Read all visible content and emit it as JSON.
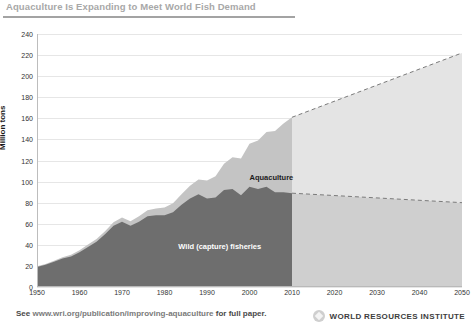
{
  "header": {
    "title": "Aquaculture Is Expanding to Meet World Fish Demand"
  },
  "footer": {
    "prefix": "See",
    "url": "www.wri.org/publication/improving-aquaculture",
    "suffix": "for full paper.",
    "org_name": "WORLD RESOURCES INSTITUTE",
    "logo_icon": "wri-diamond-icon"
  },
  "colors": {
    "wild_historical": "#6e6e6e",
    "aquaculture_historical": "#c4c4c4",
    "wild_projection": "#cfcfcf",
    "aquaculture_projection": "#e4e4e4",
    "gridline": "#e6e6e6",
    "title": "#a8a8a8",
    "dashed_line": "#7a7a7a"
  },
  "chart_data": {
    "type": "area",
    "stacked": true,
    "title": "Aquaculture Is Expanding to Meet World Fish Demand",
    "xlabel": "",
    "ylabel": "Million tons",
    "xlim": [
      1950,
      2050
    ],
    "ylim": [
      0,
      240
    ],
    "ytick_step": 20,
    "grid": true,
    "legend_position": "inline-labels",
    "projection_start": 2010,
    "yticks": [
      0,
      20,
      40,
      60,
      80,
      100,
      120,
      140,
      160,
      180,
      200,
      220,
      240
    ],
    "xticks": [
      1950,
      1960,
      1970,
      1980,
      1990,
      2000,
      2010,
      2020,
      2030,
      2040,
      2050
    ],
    "annotations": [
      {
        "text": "Aquaculture",
        "x": 2000,
        "y": 103
      },
      {
        "text": "Wild (capture) fisheries",
        "x": 1993,
        "y": 38
      }
    ],
    "series": [
      {
        "name": "Wild (capture) fisheries",
        "x": [
          1950,
          1952,
          1954,
          1956,
          1958,
          1960,
          1962,
          1964,
          1966,
          1968,
          1970,
          1972,
          1974,
          1976,
          1978,
          1980,
          1982,
          1984,
          1986,
          1988,
          1990,
          1992,
          1994,
          1996,
          1998,
          2000,
          2002,
          2004,
          2006,
          2008,
          2010
        ],
        "values": [
          19,
          21,
          24,
          27,
          29,
          33,
          38,
          43,
          50,
          58,
          62,
          58,
          62,
          67,
          68,
          68,
          71,
          78,
          84,
          88,
          84,
          85,
          92,
          93,
          87,
          95,
          93,
          95,
          90,
          90,
          89
        ]
      },
      {
        "name": "Aquaculture",
        "x": [
          1950,
          1952,
          1954,
          1956,
          1958,
          1960,
          1962,
          1964,
          1966,
          1968,
          1970,
          1972,
          1974,
          1976,
          1978,
          1980,
          1982,
          1984,
          1986,
          1988,
          1990,
          1992,
          1994,
          1996,
          1998,
          2000,
          2002,
          2004,
          2006,
          2008,
          2010
        ],
        "values": [
          0.6,
          0.8,
          1,
          1.2,
          1.5,
          1.8,
          2.2,
          2.6,
          3,
          3.4,
          3.9,
          4.4,
          5,
          5.7,
          6.5,
          7.3,
          8.4,
          10,
          12,
          14,
          17,
          20,
          25,
          30,
          35,
          41,
          46,
          52,
          58,
          65,
          72
        ]
      }
    ],
    "projection": {
      "x": [
        2010,
        2050
      ],
      "wild_values": [
        89,
        80
      ],
      "total_values": [
        161,
        222
      ]
    }
  }
}
